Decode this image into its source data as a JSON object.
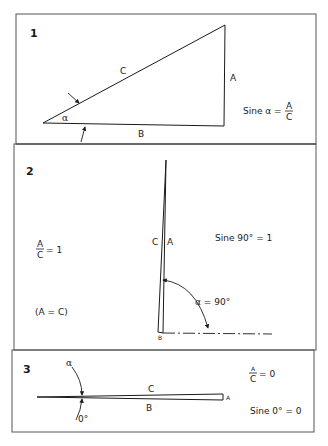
{
  "figure": {
    "panels": [
      {
        "number": "1",
        "labels": {
          "hypotenuse": "C",
          "opposite": "A",
          "adjacent": "B",
          "angle": "α"
        },
        "formula": {
          "lhs": "Sine α =",
          "numerator": "A",
          "denominator": "C"
        }
      },
      {
        "number": "2",
        "labels": {
          "hypotenuse": "C",
          "opposite": "A",
          "adjacent": "B"
        },
        "ratio": {
          "numerator": "A",
          "denominator": "C",
          "rhs": "= 1"
        },
        "equality": "(A = C)",
        "formula": "Sine 90° = 1",
        "angle_label": "α = 90°"
      },
      {
        "number": "3",
        "labels": {
          "hypotenuse": "C",
          "opposite": "A",
          "adjacent": "B",
          "angle": "α",
          "angle_value": "0°"
        },
        "ratio": {
          "numerator": "A",
          "denominator": "C",
          "rhs": "= 0"
        },
        "formula": "Sine 0° = 0"
      }
    ],
    "colors": {
      "line": "#1a1a1a",
      "border": "#555555",
      "background": "#ffffff"
    }
  }
}
